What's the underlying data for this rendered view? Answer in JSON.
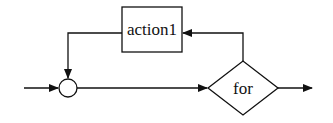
{
  "diagram": {
    "type": "flowchart-loop",
    "nodes": [
      {
        "id": "merge",
        "shape": "circle",
        "label": ""
      },
      {
        "id": "for",
        "shape": "diamond",
        "label": "for"
      },
      {
        "id": "action1",
        "shape": "rectangle",
        "label": "action1"
      }
    ],
    "edges": [
      {
        "from": "entry",
        "to": "merge"
      },
      {
        "from": "merge",
        "to": "for"
      },
      {
        "from": "for",
        "to": "action1"
      },
      {
        "from": "action1",
        "to": "merge"
      },
      {
        "from": "for",
        "to": "exit"
      }
    ]
  }
}
